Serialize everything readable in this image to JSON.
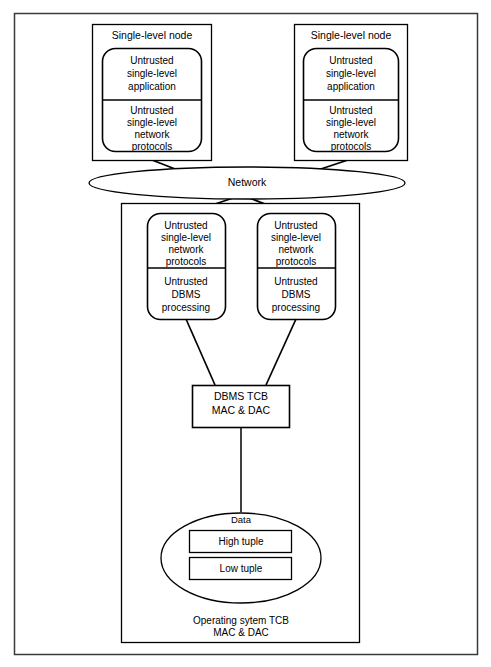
{
  "diagram": {
    "title_text_present": false,
    "nodes": {
      "left_node": {
        "title": "Single-level node",
        "upper_compartment": [
          "Untrusted",
          "single-level",
          "application"
        ],
        "lower_compartment": [
          "Untrusted",
          "single-level",
          "network",
          "protocols"
        ]
      },
      "right_node": {
        "title": "Single-level node",
        "upper_compartment": [
          "Untrusted",
          "single-level",
          "application"
        ],
        "lower_compartment": [
          "Untrusted",
          "single-level",
          "network",
          "protocols"
        ]
      }
    },
    "network": {
      "label": "Network"
    },
    "server": {
      "left_module": {
        "upper_compartment": [
          "Untrusted",
          "single-level",
          "network",
          "protocols"
        ],
        "lower_compartment": [
          "Untrusted",
          "DBMS",
          "processing"
        ]
      },
      "right_module": {
        "upper_compartment": [
          "Untrusted",
          "single-level",
          "network",
          "protocols"
        ],
        "lower_compartment": [
          "Untrusted",
          "DBMS",
          "processing"
        ]
      },
      "dbms_tcb": {
        "line1": "DBMS TCB",
        "line2": "MAC & DAC"
      },
      "data_store": {
        "label": "Data",
        "tuples": [
          {
            "label": "High tuple"
          },
          {
            "label": "Low tuple"
          }
        ]
      },
      "os_tcb": {
        "line1": "Operating sytem TCB",
        "line2": "MAC & DAC"
      }
    },
    "colors": {
      "stroke": "#000000",
      "frame_stroke": "#3a3a3a",
      "fill": "#ffffff"
    }
  }
}
